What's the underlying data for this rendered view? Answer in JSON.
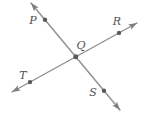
{
  "diagram": {
    "points": [
      {
        "label": "P",
        "x": 45,
        "y": 19.8
      },
      {
        "label": "Q",
        "x": 75.8,
        "y": 56.8
      },
      {
        "label": "R",
        "x": 119,
        "y": 32.9
      },
      {
        "label": "S",
        "x": 104,
        "y": 90.7
      },
      {
        "label": "T",
        "x": 30,
        "y": 82.1
      }
    ],
    "lines": [
      {
        "name": "line-through-P-Q-S",
        "from": [
          31,
          3
        ],
        "to": [
          120,
          110
        ],
        "arrows": "both"
      },
      {
        "name": "line-through-T-Q-R",
        "from": [
          12,
          92
        ],
        "to": [
          137,
          23
        ],
        "arrows": "both"
      }
    ],
    "colors": {
      "line": "#8f8f8f",
      "arrowhead": "#7d7d7d",
      "point": "#5a5a5a",
      "label": "#4f4f4f",
      "background": "#ffffff"
    }
  }
}
